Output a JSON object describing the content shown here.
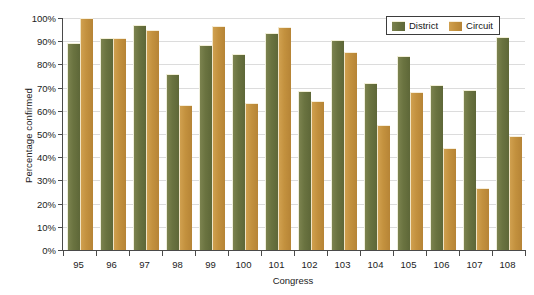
{
  "chart_data": {
    "type": "bar",
    "title": "",
    "xlabel": "Congress",
    "ylabel": "Percentage confirmed",
    "ylim": [
      0,
      100
    ],
    "yticks": [
      "0%",
      "10%",
      "20%",
      "30%",
      "40%",
      "50%",
      "60%",
      "70%",
      "80%",
      "90%",
      "100%"
    ],
    "ytick_values": [
      0,
      10,
      20,
      30,
      40,
      50,
      60,
      70,
      80,
      90,
      100
    ],
    "grid": true,
    "legend_position": "top-right",
    "categories": [
      "95",
      "96",
      "97",
      "98",
      "99",
      "100",
      "101",
      "102",
      "103",
      "104",
      "105",
      "106",
      "107",
      "108"
    ],
    "series": [
      {
        "name": "District",
        "color": "#6a7340",
        "values": [
          89,
          91,
          96.5,
          75.5,
          88,
          84,
          93,
          68,
          90,
          71.5,
          83,
          70.5,
          68.5,
          91.5
        ]
      },
      {
        "name": "Circuit",
        "color": "#c3913e",
        "values": [
          99.5,
          91,
          94.5,
          62,
          96,
          63,
          95.5,
          64,
          85,
          53.5,
          67.5,
          43.5,
          26.5,
          48.5
        ]
      }
    ]
  },
  "legend": {
    "entries": [
      {
        "label": "District",
        "swatch": "district-swatch"
      },
      {
        "label": "Circuit",
        "swatch": "circuit-swatch"
      }
    ]
  }
}
